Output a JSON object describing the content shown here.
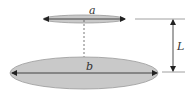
{
  "diagram": {
    "labels": {
      "top_ellipse": "a",
      "bottom_ellipse": "b",
      "distance": "L"
    },
    "colors": {
      "ellipse_fill": "#c9c9c9",
      "ellipse_stroke": "#9a9a9a",
      "line": "#333333",
      "guide": "#888888"
    }
  }
}
